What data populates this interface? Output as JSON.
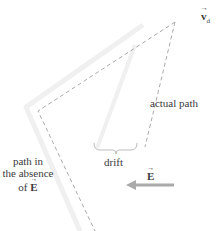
{
  "labels": {
    "velocity_symbol": "v",
    "velocity_subscript": "d",
    "actual_path": "actual path",
    "drift": "drift",
    "field_symbol": "E",
    "absence_line1": "path in",
    "absence_line2": "the absence",
    "absence_line3_prefix": "of ",
    "absence_symbol": "E"
  },
  "colors": {
    "dashed_path": "#aaaaaa",
    "absence_band": "#eeeeee",
    "arrow": "#aaaaaa",
    "text": "#3a3a3a"
  }
}
